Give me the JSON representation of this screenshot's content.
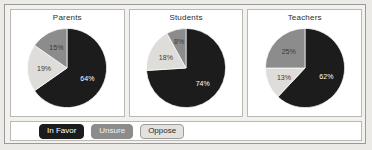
{
  "legend": {
    "items": [
      {
        "label": "In Favor",
        "color": "#1c1c1c"
      },
      {
        "label": "Unsure",
        "color": "#8c8c8c"
      },
      {
        "label": "Oppose",
        "color": "#e3e2de"
      }
    ]
  },
  "colors": {
    "in_favor": "#1c1c1c",
    "unsure": "#dedddA",
    "oppose": "#8c8c8c",
    "panel_border": "#b9b8b4",
    "frame_border": "#9a9a96",
    "background": "#eceae6"
  },
  "chart_data": [
    {
      "type": "pie",
      "title": "Parents",
      "categories": [
        "In Favor",
        "Unsure",
        "Oppose"
      ],
      "values": [
        64,
        19,
        15
      ],
      "labels": [
        "64%",
        "19%",
        "15%"
      ],
      "legend_position": "bottom"
    },
    {
      "type": "pie",
      "title": "Students",
      "categories": [
        "In Favor",
        "Unsure",
        "Oppose"
      ],
      "values": [
        74,
        18,
        8
      ],
      "labels": [
        "74%",
        "18%",
        "8%"
      ],
      "legend_position": "bottom"
    },
    {
      "type": "pie",
      "title": "Teachers",
      "categories": [
        "In Favor",
        "Unsure",
        "Oppose"
      ],
      "values": [
        62,
        13,
        25
      ],
      "labels": [
        "62%",
        "13%",
        "25%"
      ],
      "legend_position": "bottom"
    }
  ]
}
